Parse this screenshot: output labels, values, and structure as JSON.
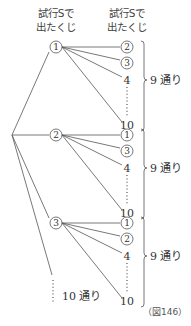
{
  "headers": {
    "first": [
      "試行Sで",
      "出たくじ"
    ],
    "second": [
      "試行Sで",
      "出たくじ"
    ]
  },
  "branches": [
    {
      "first": "1",
      "seconds": [
        "2",
        "3",
        "4",
        "10"
      ],
      "circled": [
        true,
        true,
        false,
        false
      ],
      "count_label": "9 通り"
    },
    {
      "first": "2",
      "seconds": [
        "1",
        "3",
        "4",
        "10"
      ],
      "circled": [
        true,
        true,
        false,
        false
      ],
      "count_label": "9 通り"
    },
    {
      "first": "3",
      "seconds": [
        "1",
        "2",
        "4",
        "10"
      ],
      "circled": [
        true,
        true,
        false,
        false
      ],
      "count_label": "9 通り"
    }
  ],
  "remaining_label": "10 通り",
  "figure_label": "（図146）"
}
